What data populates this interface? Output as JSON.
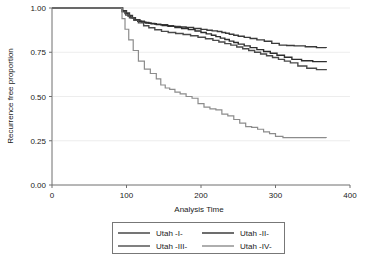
{
  "chart_data": {
    "type": "line",
    "title": "",
    "xlabel": "Analysis Time",
    "ylabel": "Recurrence free proportion",
    "xlim": [
      0,
      400
    ],
    "ylim": [
      0,
      1.0
    ],
    "xticks": [
      0,
      100,
      200,
      300,
      400
    ],
    "xtick_labels": [
      "0",
      "100",
      "200",
      "300",
      "400"
    ],
    "yticks": [
      0.0,
      0.25,
      0.5,
      0.75,
      1.0
    ],
    "ytick_labels": [
      "0.00",
      "0.25",
      "0.50",
      "0.75",
      "1.00"
    ],
    "grid": "horizontal-light",
    "legend_position": "bottom-center",
    "step_type": "post",
    "series": [
      {
        "name": "Utah -I-",
        "color": "#3a3a3a",
        "width": 1.4,
        "x": [
          0,
          90,
          95,
          100,
          104,
          108,
          112,
          118,
          124,
          130,
          138,
          146,
          155,
          163,
          172,
          180,
          190,
          200,
          208,
          215,
          222,
          228,
          233,
          238,
          244,
          250,
          258,
          266,
          275,
          285,
          295,
          305,
          315,
          325,
          340,
          355,
          368
        ],
        "y": [
          1.0,
          1.0,
          0.985,
          0.972,
          0.958,
          0.945,
          0.934,
          0.925,
          0.918,
          0.913,
          0.909,
          0.905,
          0.9,
          0.896,
          0.893,
          0.89,
          0.884,
          0.879,
          0.874,
          0.871,
          0.867,
          0.862,
          0.857,
          0.852,
          0.846,
          0.84,
          0.834,
          0.828,
          0.82,
          0.812,
          0.8,
          0.79,
          0.788,
          0.786,
          0.781,
          0.776,
          0.774
        ]
      },
      {
        "name": "Utah -II-",
        "color": "#2e2e2e",
        "width": 1.4,
        "x": [
          0,
          90,
          94,
          98,
          102,
          106,
          110,
          115,
          120,
          126,
          133,
          140,
          148,
          156,
          165,
          174,
          183,
          192,
          200,
          207,
          214,
          220,
          226,
          232,
          238,
          244,
          250,
          258,
          266,
          275,
          284,
          293,
          302,
          312,
          322,
          335,
          350,
          368
        ],
        "y": [
          1.0,
          1.0,
          0.982,
          0.968,
          0.955,
          0.944,
          0.933,
          0.925,
          0.92,
          0.915,
          0.911,
          0.906,
          0.901,
          0.896,
          0.89,
          0.884,
          0.878,
          0.87,
          0.862,
          0.854,
          0.846,
          0.838,
          0.83,
          0.822,
          0.813,
          0.805,
          0.796,
          0.786,
          0.776,
          0.765,
          0.754,
          0.744,
          0.733,
          0.722,
          0.71,
          0.702,
          0.697,
          0.694
        ]
      },
      {
        "name": "Utah -III-",
        "color": "#4a4a4a",
        "width": 1.4,
        "x": [
          0,
          90,
          94,
          99,
          104,
          110,
          116,
          123,
          130,
          138,
          147,
          156,
          166,
          176,
          186,
          196,
          206,
          216,
          224,
          232,
          240,
          248,
          256,
          264,
          272,
          280,
          288,
          296,
          304,
          312,
          320,
          330,
          342,
          355,
          368
        ],
        "y": [
          1.0,
          1.0,
          0.978,
          0.96,
          0.945,
          0.93,
          0.916,
          0.9,
          0.888,
          0.877,
          0.868,
          0.862,
          0.856,
          0.85,
          0.843,
          0.835,
          0.826,
          0.817,
          0.808,
          0.799,
          0.79,
          0.78,
          0.77,
          0.76,
          0.75,
          0.74,
          0.73,
          0.72,
          0.71,
          0.7,
          0.69,
          0.672,
          0.66,
          0.652,
          0.648
        ]
      },
      {
        "name": "Utah -IV-",
        "color": "#8c8c8c",
        "width": 1.2,
        "x": [
          0,
          90,
          94,
          98,
          103,
          109,
          116,
          124,
          132,
          140,
          146,
          152,
          158,
          165,
          172,
          180,
          188,
          196,
          204,
          212,
          220,
          228,
          236,
          244,
          252,
          260,
          268,
          276,
          284,
          292,
          300,
          310,
          325,
          345,
          368
        ],
        "y": [
          1.0,
          1.0,
          0.94,
          0.88,
          0.82,
          0.76,
          0.7,
          0.655,
          0.63,
          0.6,
          0.565,
          0.548,
          0.54,
          0.525,
          0.515,
          0.5,
          0.49,
          0.46,
          0.44,
          0.43,
          0.425,
          0.4,
          0.39,
          0.37,
          0.35,
          0.33,
          0.325,
          0.315,
          0.3,
          0.29,
          0.275,
          0.268,
          0.268,
          0.268,
          0.266
        ]
      }
    ]
  },
  "legend": {
    "entries": [
      {
        "label": "Utah -I-"
      },
      {
        "label": "Utah -II-"
      },
      {
        "label": "Utah -III-"
      },
      {
        "label": "Utah -IV-"
      }
    ]
  }
}
